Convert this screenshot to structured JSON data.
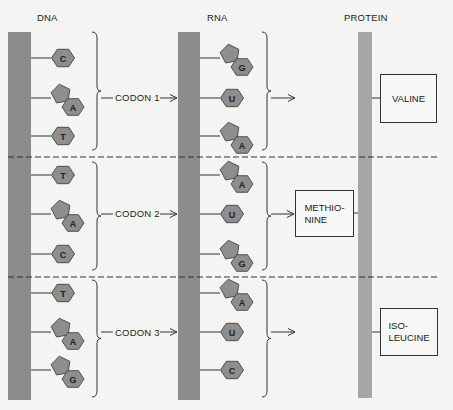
{
  "headers": {
    "dna": "DNA",
    "rna": "RNA",
    "protein": "PROTEIN"
  },
  "colors": {
    "strand": "#8c8c8c",
    "protein_strand": "#a6a6a6",
    "base_fill": "#8e8e8e",
    "base_stroke": "#333333",
    "line": "#333333",
    "background": "#f4f4f2"
  },
  "codons": [
    {
      "label": "CODON 1",
      "dna_bases": [
        {
          "letter": "C",
          "type": "pyrimidine"
        },
        {
          "letter": "A",
          "type": "purine"
        },
        {
          "letter": "T",
          "type": "pyrimidine"
        }
      ],
      "rna_bases": [
        {
          "letter": "G",
          "type": "purine"
        },
        {
          "letter": "U",
          "type": "pyrimidine"
        },
        {
          "letter": "A",
          "type": "purine"
        }
      ],
      "amino_acid": "VALINE",
      "amino_acid_lines": [
        "VALINE"
      ]
    },
    {
      "label": "CODON 2",
      "dna_bases": [
        {
          "letter": "T",
          "type": "pyrimidine"
        },
        {
          "letter": "A",
          "type": "purine"
        },
        {
          "letter": "C",
          "type": "pyrimidine"
        }
      ],
      "rna_bases": [
        {
          "letter": "A",
          "type": "purine"
        },
        {
          "letter": "U",
          "type": "pyrimidine"
        },
        {
          "letter": "G",
          "type": "purine"
        }
      ],
      "amino_acid": "METHIONINE",
      "amino_acid_lines": [
        "METHIO-",
        "NINE"
      ]
    },
    {
      "label": "CODON 3",
      "dna_bases": [
        {
          "letter": "T",
          "type": "pyrimidine"
        },
        {
          "letter": "A",
          "type": "purine"
        },
        {
          "letter": "G",
          "type": "purine"
        }
      ],
      "rna_bases": [
        {
          "letter": "A",
          "type": "purine"
        },
        {
          "letter": "U",
          "type": "pyrimidine"
        },
        {
          "letter": "C",
          "type": "pyrimidine"
        }
      ],
      "amino_acid": "ISOLEUCINE",
      "amino_acid_lines": [
        "ISO-",
        "LEUCINE"
      ]
    }
  ]
}
